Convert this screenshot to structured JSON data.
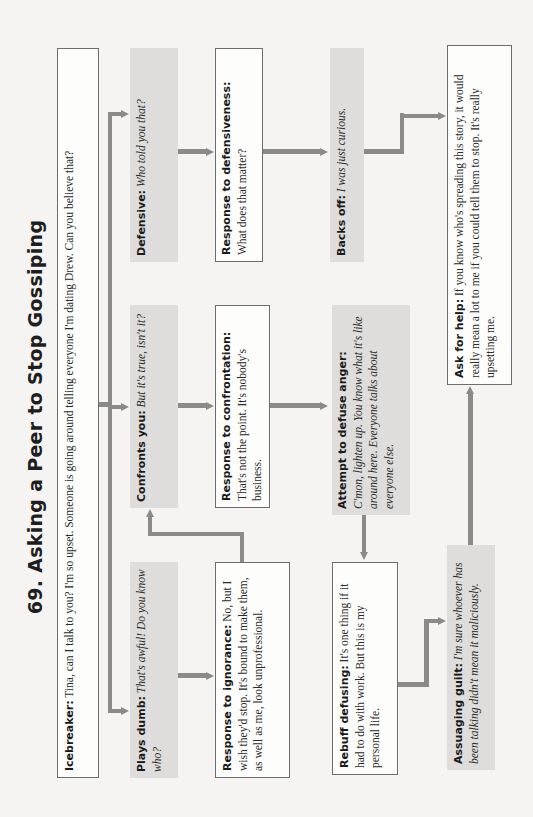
{
  "title": "69. Asking a Peer to Stop Gossiping",
  "colors": {
    "background": "#f5f4f2",
    "shaded_box": "#dedddb",
    "outlined_box_border": "#6d6d6d",
    "connector": "#8a8a8a"
  },
  "nodes": {
    "icebreaker": {
      "label": "Icebreaker:",
      "text": " Tina, can I talk to you? I'm so upset. Someone is going around telling everyone I'm dating Drew. Can you believe that?"
    },
    "plays_dumb": {
      "label": "Plays dumb:",
      "text": " That's awful! Do you know who?"
    },
    "confronts_you": {
      "label": "Confronts you:",
      "text": " But it's true, isn't it?"
    },
    "defensive": {
      "label": "Defensive:",
      "text": " Who told you that?"
    },
    "response_to_ignorance": {
      "label": "Response to ignorance:",
      "text": " No, but I wish they'd stop. It's bound to make them, as well as me, look unprofessional."
    },
    "response_to_confrontation": {
      "label": "Response to confrontation:",
      "text": "That's not the point. It's nobody's business."
    },
    "response_to_defensiveness": {
      "label": "Response to defensiveness:",
      "text": "What does that matter?"
    },
    "rebuff_defusing": {
      "label": "Rebuff defusing:",
      "text": " It's one thing if it had to do with work. But this is my personal life."
    },
    "attempt_to_defuse_anger": {
      "label": "Attempt to defuse anger:",
      "text": "C'mon, lighten up. You know what it's like around here. Everyone talks about everyone else."
    },
    "backs_off": {
      "label": "Backs off:",
      "text": " I was just curious."
    },
    "assuaging_guilt": {
      "label": "Assuaging guilt:",
      "text": " I'm sure whoever has been talking didn't mean it maliciously."
    },
    "ask_for_help": {
      "label": "Ask for help:",
      "text": " If you know who's spreading this story, it would really mean a lot to me if you could tell them to stop. It's really upsetting me."
    }
  }
}
